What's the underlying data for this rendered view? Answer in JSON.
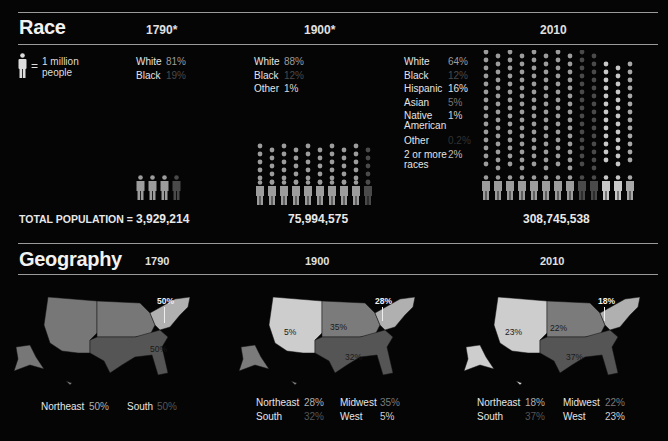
{
  "colors": {
    "background": "#050505",
    "white": "#9c9c9c",
    "black": "#4a4a4a",
    "hispanic": "#c8c8c8",
    "asian": "#777777",
    "native_american": "#bdbdbd",
    "other": "#333333",
    "two_or_more": "#a8a8a8",
    "northeast": "#b0b0b0",
    "south": "#555555",
    "midwest": "#7b7b7b",
    "west": "#cdcdcd",
    "uncounted": "#777777"
  },
  "race": {
    "title": "Race",
    "legend_key": {
      "equals": "=",
      "text_line1": "1 million",
      "text_line2": "people",
      "icon": "person-icon"
    },
    "total_label": "TOTAL POPULATION =",
    "years": [
      {
        "label": "1790*",
        "total": "3,929,214",
        "groups": [
          {
            "label": "White",
            "pct": "81%"
          },
          {
            "label": "Black",
            "pct": "19%"
          }
        ]
      },
      {
        "label": "1900*",
        "total": "75,994,575",
        "groups": [
          {
            "label": "White",
            "pct": "88%"
          },
          {
            "label": "Black",
            "pct": "12%"
          },
          {
            "label": "Other",
            "pct": "1%"
          }
        ]
      },
      {
        "label": "2010",
        "total": "308,745,538",
        "groups": [
          {
            "label": "White",
            "pct": "64%"
          },
          {
            "label": "Black",
            "pct": "12%"
          },
          {
            "label": "Hispanic",
            "pct": "16%"
          },
          {
            "label": "Asian",
            "pct": "5%"
          },
          {
            "label": "Native American",
            "pct": "1%"
          },
          {
            "label": "Other",
            "pct": "0.2%"
          },
          {
            "label": "2 or more races",
            "pct": "2%"
          }
        ]
      }
    ]
  },
  "geography": {
    "title": "Geography",
    "years": [
      {
        "label": "1790",
        "map_labels": {
          "northeast": "50%",
          "south": "50%"
        },
        "legend": [
          {
            "label": "Northeast",
            "pct": "50%"
          },
          {
            "label": "South",
            "pct": "50%"
          }
        ]
      },
      {
        "label": "1900",
        "map_labels": {
          "northeast": "28%",
          "midwest": "35%",
          "south": "32%",
          "west": "5%"
        },
        "legend": [
          {
            "label": "Northeast",
            "pct": "28%"
          },
          {
            "label": "Midwest",
            "pct": "35%"
          },
          {
            "label": "South",
            "pct": "32%"
          },
          {
            "label": "West",
            "pct": "5%"
          }
        ]
      },
      {
        "label": "2010",
        "map_labels": {
          "northeast": "18%",
          "midwest": "22%",
          "south": "37%",
          "west": "23%"
        },
        "legend": [
          {
            "label": "Northeast",
            "pct": "18%"
          },
          {
            "label": "Midwest",
            "pct": "22%"
          },
          {
            "label": "South",
            "pct": "37%"
          },
          {
            "label": "West",
            "pct": "23%"
          }
        ]
      }
    ]
  },
  "chart_data": [
    {
      "type": "pictogram",
      "title": "Race",
      "unit": "1 person icon = 1 million people",
      "categories": [
        "1790*",
        "1900*",
        "2010"
      ],
      "totals": [
        3929214,
        75994575,
        308745538
      ],
      "series": [
        {
          "name": "White",
          "values": [
            81,
            88,
            64
          ]
        },
        {
          "name": "Black",
          "values": [
            19,
            12,
            12
          ]
        },
        {
          "name": "Hispanic",
          "values": [
            null,
            null,
            16
          ]
        },
        {
          "name": "Asian",
          "values": [
            null,
            null,
            5
          ]
        },
        {
          "name": "Native American",
          "values": [
            null,
            null,
            1
          ]
        },
        {
          "name": "Other",
          "values": [
            null,
            1,
            0.2
          ]
        },
        {
          "name": "2 or more races",
          "values": [
            null,
            null,
            2
          ]
        }
      ],
      "value_unit": "%"
    },
    {
      "type": "choropleth",
      "title": "Geography",
      "categories": [
        "1790",
        "1900",
        "2010"
      ],
      "series": [
        {
          "name": "Northeast",
          "values": [
            50,
            28,
            18
          ]
        },
        {
          "name": "Midwest",
          "values": [
            null,
            35,
            22
          ]
        },
        {
          "name": "South",
          "values": [
            50,
            32,
            37
          ]
        },
        {
          "name": "West",
          "values": [
            null,
            5,
            23
          ]
        }
      ],
      "value_unit": "%"
    }
  ]
}
